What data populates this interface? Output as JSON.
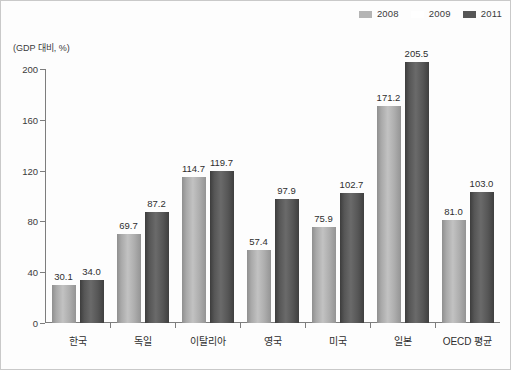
{
  "chart_data": {
    "type": "bar",
    "title": "",
    "subtitle": "",
    "xlabel": "",
    "ylabel": "(GDP 대비, %)",
    "ylim": [
      0,
      200
    ],
    "yticks": [
      0,
      40,
      80,
      120,
      160,
      200
    ],
    "grid": false,
    "legend_position": "top-right",
    "categories": [
      "한국",
      "독일",
      "이탈리아",
      "영국",
      "미국",
      "일본",
      "OECD 평균"
    ],
    "series": [
      {
        "name": "2008",
        "color": "#b4b4b4",
        "values": [
          30.1,
          69.7,
          114.7,
          57.4,
          75.9,
          171.2,
          81.0
        ],
        "labels": [
          "30.1",
          "69.7",
          "114.7",
          "57.4",
          "75.9",
          "171.2",
          "81.0"
        ]
      },
      {
        "name": "2009",
        "color": "#ffffff",
        "values": [
          null,
          null,
          null,
          null,
          null,
          null,
          null
        ],
        "labels": [
          "",
          "",
          "",
          "",
          "",
          "",
          ""
        ]
      },
      {
        "name": "2011",
        "color": "#565656",
        "values": [
          34.0,
          87.2,
          119.7,
          97.9,
          102.7,
          205.5,
          103.0
        ],
        "labels": [
          "34.0",
          "87.2",
          "119.7",
          "97.9",
          "102.7",
          "205.5",
          "103.0"
        ]
      }
    ]
  },
  "legend": {
    "items": [
      {
        "label": "2008",
        "color": "#b4b4b4"
      },
      {
        "label": "2009",
        "color": "#ffffff"
      },
      {
        "label": "2011",
        "color": "#565656"
      }
    ]
  },
  "axis": {
    "y_unit_label": "(GDP 대비, %)",
    "y_tick_labels": [
      "200",
      "160",
      "120",
      "80",
      "40",
      "0"
    ]
  }
}
